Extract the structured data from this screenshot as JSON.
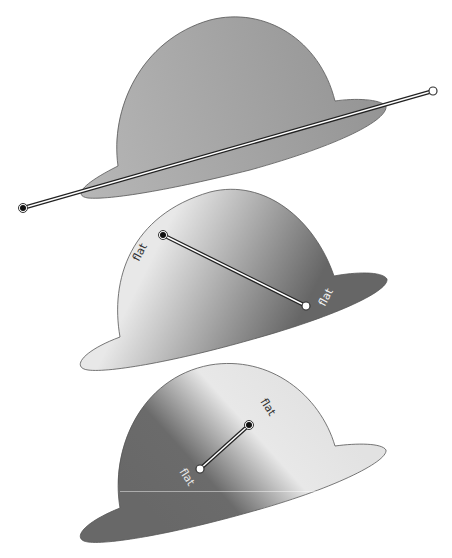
{
  "figure": {
    "colors": {
      "background": "#ffffff",
      "outline": "#555555",
      "dark_gray": "#6a6a6a",
      "mid_gray": "#a9a9a9",
      "light_gray": "#e4e4e4",
      "start_point": "#111111",
      "end_point": "#ffffff"
    }
  },
  "hats": [
    {
      "id": "hat-1",
      "gradient": {
        "type": "linear",
        "start": {
          "x": 23,
          "y": 208,
          "marker": "filled-black-circle"
        },
        "end": {
          "x": 433,
          "y": 91,
          "marker": "hollow-white-circle"
        },
        "colors": [
          "#b9b9b9",
          "#9a9a9a"
        ]
      },
      "labels": []
    },
    {
      "id": "hat-2",
      "gradient": {
        "type": "linear",
        "start": {
          "x": 163,
          "y": 235,
          "marker": "filled-black-circle"
        },
        "end": {
          "x": 306,
          "y": 306,
          "marker": "hollow-white-circle"
        },
        "colors": [
          "#e6e6e6",
          "#6a6a6a"
        ]
      },
      "labels": [
        {
          "text": "flat",
          "x": 143,
          "y": 254,
          "rotate": -62,
          "color": "#333333"
        },
        {
          "text": "flat",
          "x": 329,
          "y": 299,
          "rotate": -62,
          "color": "#f2f2f2"
        }
      ]
    },
    {
      "id": "hat-3",
      "gradient": {
        "type": "reflected",
        "start": {
          "x": 249,
          "y": 425,
          "marker": "filled-black-circle"
        },
        "end": {
          "x": 200,
          "y": 469,
          "marker": "hollow-white-circle"
        },
        "colors": [
          "#6a6a6a",
          "#e6e6e6",
          "#6a6a6a"
        ]
      },
      "labels": [
        {
          "text": "flat",
          "x": 265,
          "y": 409,
          "rotate": 57,
          "color": "#333333"
        },
        {
          "text": "flat",
          "x": 184,
          "y": 479,
          "rotate": 57,
          "color": "#e8e8e8"
        }
      ]
    }
  ]
}
